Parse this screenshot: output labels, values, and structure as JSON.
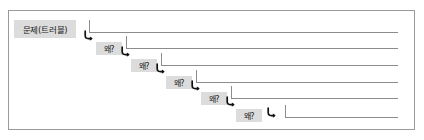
{
  "figure": {
    "name": "five-whys-diagram",
    "frame": {
      "border_color": "#9a9a9a",
      "background": "#ffffff"
    },
    "line_color": "#8c8c8c",
    "chip_background": "#dcdcdc",
    "chip_text_color": "#1a1a1a"
  },
  "root": {
    "label": "문제(트러블)",
    "icon": "corner-down-right-arrow-icon"
  },
  "levels": [
    {
      "label": "왜?",
      "icon": "corner-down-right-arrow-icon"
    },
    {
      "label": "왜?",
      "icon": "corner-down-right-arrow-icon"
    },
    {
      "label": "왜?",
      "icon": "corner-down-right-arrow-icon"
    },
    {
      "label": "왜?",
      "icon": "corner-down-right-arrow-icon"
    },
    {
      "label": "왜?",
      "icon": "corner-down-right-arrow-icon"
    }
  ]
}
